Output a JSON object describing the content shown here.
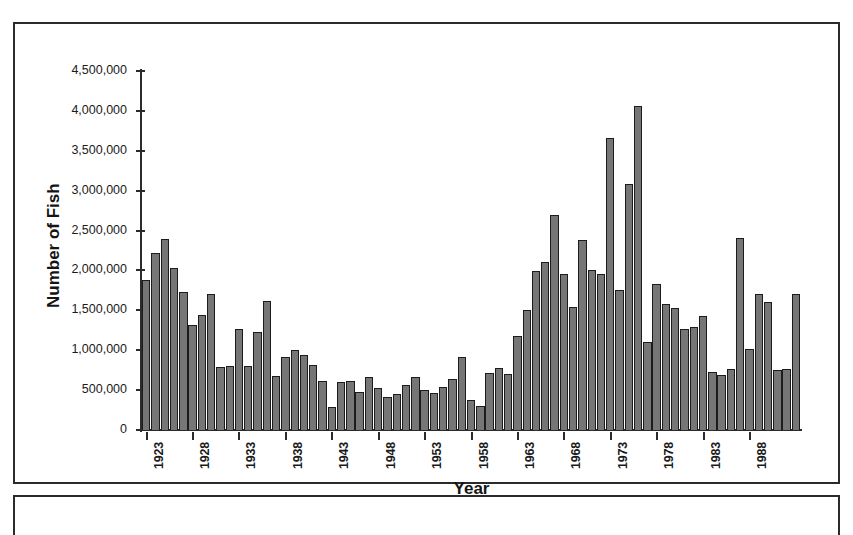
{
  "chart_data": {
    "type": "bar",
    "title": "",
    "xlabel": "Year",
    "ylabel": "Number of Fish",
    "ylim": [
      0,
      4500000
    ],
    "ytick_labels": [
      "4,500,000",
      "4,000,000",
      "3,500,000",
      "3,000,000",
      "2,500,000",
      "2,000,000",
      "1,500,000",
      "1,000,000",
      "500,000",
      "0"
    ],
    "ytick_values": [
      4500000,
      4000000,
      3500000,
      3000000,
      2500000,
      2000000,
      1500000,
      1000000,
      500000,
      0
    ],
    "xtick_labels": [
      "1923",
      "1928",
      "1933",
      "1938",
      "1943",
      "1948",
      "1953",
      "1958",
      "1963",
      "1968",
      "1973",
      "1978",
      "1983",
      "1988"
    ],
    "xtick_values": [
      1923,
      1928,
      1933,
      1938,
      1943,
      1948,
      1953,
      1958,
      1963,
      1968,
      1973,
      1978,
      1983,
      1988
    ],
    "grid": false,
    "legend": false,
    "bar_color": "#767676",
    "bar_edge_color": "#1c1c1c",
    "categories": [
      1923,
      1924,
      1925,
      1926,
      1927,
      1928,
      1929,
      1930,
      1931,
      1932,
      1933,
      1934,
      1935,
      1936,
      1937,
      1938,
      1939,
      1940,
      1941,
      1942,
      1943,
      1944,
      1945,
      1946,
      1947,
      1948,
      1949,
      1950,
      1951,
      1952,
      1953,
      1954,
      1955,
      1956,
      1957,
      1958,
      1959,
      1960,
      1961,
      1962,
      1963,
      1964,
      1965,
      1966,
      1967,
      1968,
      1969,
      1970,
      1971,
      1972,
      1973,
      1974,
      1975,
      1976,
      1977,
      1978,
      1979,
      1980,
      1981,
      1982,
      1983,
      1984,
      1985,
      1986,
      1987,
      1988,
      1989,
      1990,
      1991,
      1992,
      1993
    ],
    "values": [
      1880000,
      2220000,
      2400000,
      2030000,
      1730000,
      1320000,
      1440000,
      1700000,
      790000,
      800000,
      1270000,
      800000,
      1230000,
      1620000,
      680000,
      920000,
      1000000,
      940000,
      810000,
      610000,
      290000,
      600000,
      620000,
      480000,
      670000,
      530000,
      420000,
      450000,
      560000,
      670000,
      500000,
      470000,
      540000,
      640000,
      910000,
      380000,
      300000,
      720000,
      780000,
      700000,
      1180000,
      1510000,
      1990000,
      2100000,
      2700000,
      1960000,
      1540000,
      2380000,
      2010000,
      1950000,
      3660000,
      1750000,
      3080000,
      4060000,
      1100000,
      1830000,
      1580000,
      1530000,
      1260000,
      1290000,
      1430000,
      730000,
      690000,
      760000,
      2410000,
      1010000,
      1710000,
      1600000,
      750000,
      770000,
      1710000
    ]
  }
}
